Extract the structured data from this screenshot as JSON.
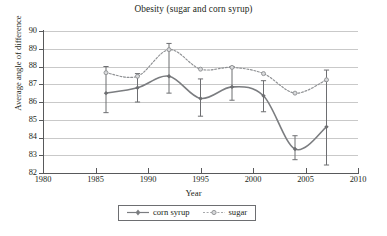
{
  "chart_data": {
    "type": "line",
    "title": "Obesity (sugar and corn syrup)",
    "xlabel": "Year",
    "ylabel": "Average angle of difference",
    "xlim": [
      1980,
      2010
    ],
    "ylim": [
      82,
      90
    ],
    "xticks": [
      1980,
      1985,
      1990,
      1995,
      2000,
      2005,
      2010
    ],
    "yticks": [
      82,
      83,
      84,
      85,
      86,
      87,
      88,
      89,
      90
    ],
    "grid": "horizontal",
    "legend_position": "bottom-center",
    "x": [
      1986,
      1989,
      1992,
      1995,
      1998,
      2001,
      2004,
      2007
    ],
    "series": [
      {
        "name": "corn syrup",
        "style": "solid",
        "color": "#7b7d80",
        "marker": "filled-diamond",
        "values": [
          86.5,
          86.8,
          87.45,
          86.2,
          86.85,
          86.35,
          83.35,
          84.6
        ],
        "error_low": [
          85.4,
          86.0,
          86.5,
          85.2,
          86.1,
          85.45,
          82.75,
          82.45
        ],
        "error_high": [
          88.0,
          87.6,
          89.3,
          87.3,
          88.0,
          87.2,
          84.1,
          87.8
        ]
      },
      {
        "name": "sugar",
        "style": "dotted",
        "color": "#a7a9ac",
        "marker": "open-circle",
        "values": [
          87.65,
          87.45,
          88.95,
          87.85,
          87.95,
          87.6,
          86.5,
          87.25
        ],
        "error_low": [
          87.65,
          87.45,
          88.95,
          87.85,
          87.95,
          87.6,
          86.5,
          87.25
        ],
        "error_high": [
          87.65,
          87.45,
          88.95,
          87.85,
          87.95,
          87.6,
          86.5,
          87.25
        ]
      }
    ]
  },
  "legend": {
    "entries": [
      {
        "label": "corn syrup"
      },
      {
        "label": "sugar"
      }
    ]
  },
  "colors": {
    "corn_syrup": "#7b7d80",
    "sugar": "#a7a9ac",
    "axis": "#58595b",
    "grid": "#c9c9c9",
    "text": "#231f20"
  }
}
